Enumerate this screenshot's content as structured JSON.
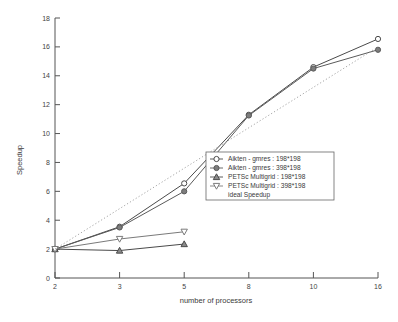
{
  "chart_data": {
    "type": "line",
    "title": "",
    "xlabel": "number of processors",
    "ylabel": "Speedup",
    "x": [
      2,
      3,
      5,
      8,
      10,
      16
    ],
    "xticklabels": [
      "2",
      "3",
      "5",
      "8",
      "10",
      "16"
    ],
    "yticklabels": [
      "0",
      "2",
      "4",
      "6",
      "8",
      "10",
      "12",
      "14",
      "16",
      "18"
    ],
    "ylim": [
      0,
      18
    ],
    "ytick_step": 2,
    "grid": false,
    "legend_position": "center-right",
    "series": [
      {
        "name": "Aikten - gmres : 198*198",
        "marker": "circle-open",
        "linestyle": "solid",
        "color": "#4a4a4a",
        "x": [
          2,
          3,
          5,
          8,
          10,
          16
        ],
        "values": [
          2.0,
          3.55,
          6.55,
          11.3,
          14.6,
          16.55
        ]
      },
      {
        "name": "Aikten - gmres : 398*198",
        "marker": "circle-filled",
        "linestyle": "solid",
        "color": "#5a5a5a",
        "x": [
          2,
          3,
          5,
          8,
          10,
          16
        ],
        "values": [
          2.0,
          3.5,
          6.0,
          11.25,
          14.5,
          15.8
        ]
      },
      {
        "name": "PETSc Multigrid : 198*198",
        "marker": "triangle-up",
        "linestyle": "solid",
        "color": "#4a4a4a",
        "x": [
          2,
          3,
          5
        ],
        "values": [
          2.0,
          1.9,
          2.35
        ]
      },
      {
        "name": "PETSc Multigrid : 398*198",
        "marker": "triangle-down",
        "linestyle": "solid",
        "color": "#7a7a7a",
        "x": [
          2,
          3,
          5
        ],
        "values": [
          2.0,
          2.7,
          3.2
        ]
      },
      {
        "name": "ideal Speedup",
        "marker": "none",
        "linestyle": "dotted",
        "color": "#9a9a9a",
        "x": [
          2,
          16
        ],
        "values": [
          2.0,
          16.0
        ]
      }
    ],
    "legend_entries": [
      "Aikten - gmres : 198*198",
      "Aikten - gmres : 398*198",
      " PETSc Multigrid : 198*198",
      "PETSc Multigrid : 398*198",
      "ideal Speedup"
    ]
  },
  "axes": {
    "y_title": "Speedup",
    "x_title": "number of processors"
  }
}
